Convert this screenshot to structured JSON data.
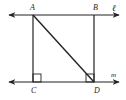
{
  "diagram": {
    "type": "geometry",
    "lines": [
      {
        "name": "l",
        "label": "ℓ",
        "through": [
          "A",
          "B"
        ],
        "y": 15
      },
      {
        "name": "m",
        "label": "m",
        "through": [
          "C",
          "D"
        ],
        "y": 82
      }
    ],
    "points": [
      {
        "name": "A",
        "label": "A",
        "x": 33,
        "y": 15
      },
      {
        "name": "B",
        "label": "B",
        "x": 94,
        "y": 15
      },
      {
        "name": "C",
        "label": "C",
        "x": 33,
        "y": 82
      },
      {
        "name": "D",
        "label": "D",
        "x": 94,
        "y": 82
      }
    ],
    "segments": [
      [
        "A",
        "C"
      ],
      [
        "B",
        "D"
      ],
      [
        "A",
        "D"
      ]
    ],
    "right_angles": [
      "C",
      "D"
    ],
    "color": "#222222"
  }
}
